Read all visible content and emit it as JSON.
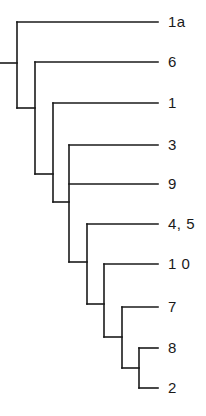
{
  "diagram": {
    "type": "cladogram",
    "line_color": "#1a1a1a",
    "leaves": [
      {
        "label": "1a",
        "y": 22
      },
      {
        "label": "6",
        "y": 62
      },
      {
        "label": "1",
        "y": 103
      },
      {
        "label": "3",
        "y": 145
      },
      {
        "label": "9",
        "y": 184
      },
      {
        "label": "4, 5",
        "y": 224
      },
      {
        "label": "1 0",
        "y": 264
      },
      {
        "label": "7",
        "y": 307
      },
      {
        "label": "8",
        "y": 348
      },
      {
        "label": "2",
        "y": 388
      }
    ],
    "leaf_end_x": 158,
    "label_x": 168,
    "root_stub": {
      "x1": 0,
      "x2": 17,
      "y": 63
    },
    "nodes": [
      {
        "id": "root",
        "x": 17,
        "y_top": 22,
        "y_bottom": 108,
        "children": [
          "leaf:1a",
          "node:A"
        ]
      },
      {
        "id": "A",
        "x": 35,
        "y_top": 62,
        "y_bottom": 174,
        "children": [
          "leaf:6",
          "node:B"
        ]
      },
      {
        "id": "B",
        "x": 53,
        "y_top": 103,
        "y_bottom": 202,
        "children": [
          "leaf:1",
          "node:C"
        ]
      },
      {
        "id": "C",
        "x": 69,
        "y_top": 145,
        "y_bottom": 262,
        "children": [
          "leaf:3",
          "leaf:9",
          "node:D"
        ]
      },
      {
        "id": "D",
        "x": 87,
        "y_top": 224,
        "y_bottom": 304,
        "children": [
          "leaf:4, 5",
          "node:E"
        ]
      },
      {
        "id": "E",
        "x": 104,
        "y_top": 264,
        "y_bottom": 337,
        "children": [
          "leaf:1 0",
          "node:F"
        ]
      },
      {
        "id": "F",
        "x": 122,
        "y_top": 307,
        "y_bottom": 368,
        "children": [
          "leaf:7",
          "node:G"
        ]
      },
      {
        "id": "G",
        "x": 139,
        "y_top": 348,
        "y_bottom": 388,
        "children": [
          "leaf:8",
          "leaf:2"
        ]
      }
    ]
  }
}
